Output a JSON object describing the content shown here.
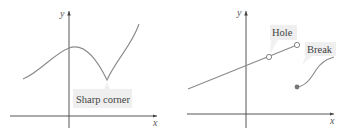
{
  "figure": {
    "panels": [
      {
        "id": "left",
        "axes": {
          "x_label": "x",
          "y_label": "y"
        },
        "callout": {
          "text": "Sharp corner"
        },
        "feature": "sharp-corner"
      },
      {
        "id": "right",
        "axes": {
          "x_label": "x",
          "y_label": "y"
        },
        "callouts": [
          {
            "text": "Hole"
          },
          {
            "text": "Break"
          }
        ],
        "features": [
          "hole",
          "break"
        ]
      }
    ],
    "colors": {
      "axis": "#444444",
      "curve": "#8a8a8a",
      "callout_bg": "#efefef",
      "text": "#444444"
    }
  }
}
